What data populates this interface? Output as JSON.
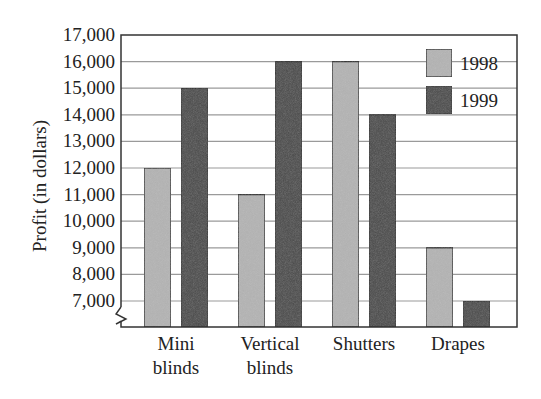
{
  "chart_data": {
    "type": "bar",
    "title": "",
    "xlabel": "",
    "ylabel": "Profit (in dollars)",
    "categories": [
      "Mini blinds",
      "Vertical blinds",
      "Shutters",
      "Drapes"
    ],
    "category_lines": [
      [
        "Mini",
        "blinds"
      ],
      [
        "Vertical",
        "blinds"
      ],
      [
        "Shutters"
      ],
      [
        "Drapes"
      ]
    ],
    "series": [
      {
        "name": "1998",
        "color": "#b4b4b4",
        "values": [
          12000,
          11000,
          16000,
          9000
        ]
      },
      {
        "name": "1999",
        "color": "#4a4a4a",
        "values": [
          15000,
          16000,
          14000,
          7000
        ]
      }
    ],
    "ylim": [
      6000,
      17000
    ],
    "yticks": [
      7000,
      8000,
      9000,
      10000,
      11000,
      12000,
      13000,
      14000,
      15000,
      16000,
      17000
    ],
    "ytick_labels": [
      "7,000",
      "8,000",
      "9,000",
      "10,000",
      "11,000",
      "12,000",
      "13,000",
      "14,000",
      "15,000",
      "16,000",
      "17,000"
    ],
    "axis_break": true,
    "grid": true,
    "legend_position": "upper right (inside)"
  },
  "legend": {
    "items": [
      {
        "label": "1998",
        "color": "#b4b4b4"
      },
      {
        "label": "1999",
        "color": "#4a4a4a"
      }
    ]
  }
}
